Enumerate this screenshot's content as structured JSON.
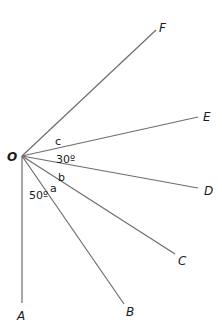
{
  "diagram": {
    "origin": {
      "label": "O",
      "x": 22,
      "y": 156
    },
    "rays": [
      {
        "label": "A",
        "end": [
          22,
          303
        ],
        "label_pos": [
          17,
          320
        ]
      },
      {
        "label": "B",
        "end": [
          124,
          304
        ],
        "label_pos": [
          126,
          316
        ]
      },
      {
        "label": "C",
        "end": [
          175,
          254
        ],
        "label_pos": [
          178,
          265
        ]
      },
      {
        "label": "D",
        "end": [
          198,
          188
        ],
        "label_pos": [
          204,
          195
        ]
      },
      {
        "label": "E",
        "end": [
          198,
          117
        ],
        "label_pos": [
          203,
          121
        ]
      },
      {
        "label": "F",
        "end": [
          156,
          30
        ],
        "label_pos": [
          159,
          32
        ]
      }
    ],
    "angle_labels": [
      {
        "text": "50º",
        "between": "A-B",
        "pos": [
          30,
          199
        ]
      },
      {
        "text": "a",
        "between": "B-C",
        "pos": [
          50,
          191
        ]
      },
      {
        "text": "b",
        "between": "C-D",
        "pos": [
          57,
          178
        ]
      },
      {
        "text": "30º",
        "between": "D-E",
        "pos": [
          56,
          161
        ]
      },
      {
        "text": "c",
        "between": "E-F",
        "pos": [
          55,
          145
        ]
      }
    ]
  }
}
